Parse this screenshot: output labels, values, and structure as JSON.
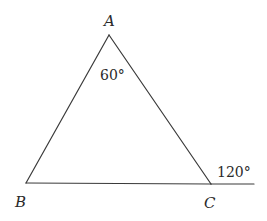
{
  "diagram": {
    "type": "triangle-with-exterior-angle",
    "vertices": {
      "A": {
        "label": "A",
        "x": 109,
        "y": 35
      },
      "B": {
        "label": "B",
        "x": 26,
        "y": 183
      },
      "C": {
        "label": "C",
        "x": 211,
        "y": 184
      }
    },
    "extension_end": {
      "x": 254,
      "y": 184
    },
    "angles": {
      "interior_A": {
        "label": "60°"
      },
      "exterior_C": {
        "label": "120°"
      }
    },
    "colors": {
      "stroke": "#3a3a3a",
      "text": "#2a2a2a",
      "background": "#ffffff"
    }
  }
}
